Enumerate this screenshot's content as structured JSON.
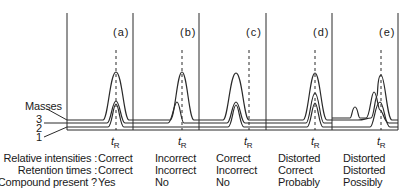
{
  "figure": {
    "masses_label": "Masses",
    "masses": [
      "3",
      "2",
      "1"
    ],
    "retention_label": "t",
    "retention_sub": "R",
    "panels": [
      {
        "id": "a",
        "label": "(a)",
        "relative_intensities": "Correct",
        "retention_times": "Correct",
        "compound_present": "Yes"
      },
      {
        "id": "b",
        "label": "(b)",
        "relative_intensities": "Incorrect",
        "retention_times": "Incorrect",
        "compound_present": "No"
      },
      {
        "id": "c",
        "label": "(c)",
        "relative_intensities": "Correct",
        "retention_times": "Incorrect",
        "compound_present": "No"
      },
      {
        "id": "d",
        "label": "(d)",
        "relative_intensities": "Distorted",
        "retention_times": "Correct",
        "compound_present": "Probably"
      },
      {
        "id": "e",
        "label": "(e)",
        "relative_intensities": "Distorted",
        "retention_times": "Distorted",
        "compound_present": "Possibly"
      }
    ],
    "row_labels": {
      "relative_intensities": "Relative intensities :",
      "retention_times": "Retention times :",
      "compound_present": "Compound present ?"
    }
  },
  "colors": {
    "line": "#2a2a2a",
    "background": "#ffffff"
  }
}
